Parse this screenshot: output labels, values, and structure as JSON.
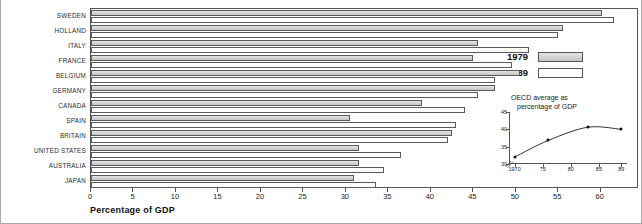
{
  "chart_data": {
    "type": "bar",
    "orientation": "horizontal",
    "title": "",
    "xlabel": "Percentage of GDP",
    "ylabel": "",
    "xlim": [
      0,
      64.5
    ],
    "grid": false,
    "legend_position": "right",
    "xticks": [
      0,
      5,
      10,
      15,
      20,
      25,
      30,
      35,
      40,
      45,
      50,
      55,
      60
    ],
    "xtick_labels": [
      "0",
      "5",
      "10",
      "15",
      "20",
      "25",
      "30",
      "35",
      "40",
      "45",
      "50",
      "55",
      "60"
    ],
    "categories": [
      "SWEDEN",
      "HOLLAND",
      "ITALY",
      "FRANCE",
      "BELGIUM",
      "GERMANY",
      "CANADA",
      "SPAIN",
      "BRITAIN",
      "UNITED STATES",
      "AUSTRALIA",
      "JAPAN"
    ],
    "series": [
      {
        "name": "1979",
        "color": "#d2d2d2",
        "values": [
          60.1,
          55.5,
          45.5,
          45.0,
          50.5,
          47.5,
          39.0,
          30.5,
          42.5,
          31.5,
          31.5,
          31.0
        ]
      },
      {
        "name": "1989",
        "color": "#ffffff",
        "values": [
          61.5,
          55.0,
          51.5,
          49.5,
          47.5,
          45.5,
          44.0,
          43.0,
          42.0,
          36.5,
          34.5,
          33.5
        ]
      }
    ]
  },
  "legend": {
    "entries": [
      {
        "label": "1979",
        "swatch": "shaded"
      },
      {
        "label": "1989",
        "swatch": "open"
      }
    ]
  },
  "inset": {
    "title_line1": "OECD average as",
    "title_line2": "percentage of GDP",
    "type": "line",
    "xlabel": "",
    "ylabel": "",
    "ylim": [
      30,
      45
    ],
    "yticks": [
      30,
      35,
      40,
      45
    ],
    "ytick_labels": [
      "30",
      "35",
      "40",
      "45"
    ],
    "xlim": [
      1969,
      1990
    ],
    "xticks": [
      1970,
      1975,
      1980,
      1985,
      1989
    ],
    "xtick_labels": [
      "1970",
      "75",
      "80",
      "85",
      "89"
    ],
    "x": [
      1970,
      1976,
      1983,
      1989
    ],
    "y": [
      32.0,
      36.8,
      40.6,
      40.0
    ],
    "axis_break": true
  }
}
